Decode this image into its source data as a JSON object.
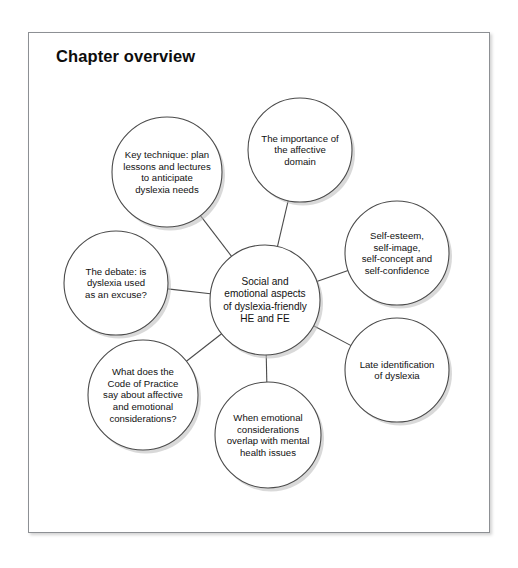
{
  "page": {
    "title": "Chapter overview",
    "frame_border_color": "#8d9094",
    "circle_stroke_color": "#4b4b4b",
    "text_color": "#111111",
    "background_color": "#ffffff"
  },
  "chart_data": {
    "type": "diagram",
    "diagram_style": "hub-and-spoke mind map",
    "title": "Chapter overview",
    "center": {
      "label": "Social and emotional aspects of dyslexia-friendly HE and FE",
      "lines": [
        "Social and",
        "emotional aspects",
        "of dyslexia-friendly",
        "HE and FE"
      ],
      "cx": 237,
      "cy": 268,
      "r": 55
    },
    "nodes": [
      {
        "id": "key-technique",
        "label": "Key technique: plan lessons and lectures to anticipate dyslexia needs",
        "lines": [
          "Key technique: plan",
          "lessons and lectures",
          "to anticipate",
          "dyslexia needs"
        ],
        "cx": 139,
        "cy": 140,
        "r": 55
      },
      {
        "id": "affective-domain",
        "label": "The importance of the affective domain",
        "lines": [
          "The importance of",
          "the affective",
          "domain"
        ],
        "cx": 272,
        "cy": 118,
        "r": 52
      },
      {
        "id": "self-esteem",
        "label": "Self-esteem, self-image, self-concept and self-confidence",
        "lines": [
          "Self-esteem,",
          "self-image,",
          "self-concept and",
          "self-confidence"
        ],
        "cx": 369,
        "cy": 221,
        "r": 52
      },
      {
        "id": "late-identification",
        "label": "Late identification of dyslexia",
        "lines": [
          "Late identification",
          "of dyslexia"
        ],
        "cx": 369,
        "cy": 338,
        "r": 52
      },
      {
        "id": "mental-health",
        "label": "When emotional considerations overlap with mental health issues",
        "lines": [
          "When emotional",
          "considerations",
          "overlap with mental",
          "health issues"
        ],
        "cx": 240,
        "cy": 403,
        "r": 53
      },
      {
        "id": "code-of-practice",
        "label": "What does the Code of Practice say about affective and emotional considerations?",
        "lines": [
          "What does the",
          "Code of Practice",
          "say about affective",
          "and emotional",
          "considerations?"
        ],
        "cx": 115,
        "cy": 363,
        "r": 55
      },
      {
        "id": "the-debate",
        "label": "The debate: is dyslexia used as an excuse?",
        "lines": [
          "The debate: is",
          "dyslexia used",
          "as an excuse?"
        ],
        "cx": 88,
        "cy": 251,
        "r": 52
      }
    ]
  }
}
